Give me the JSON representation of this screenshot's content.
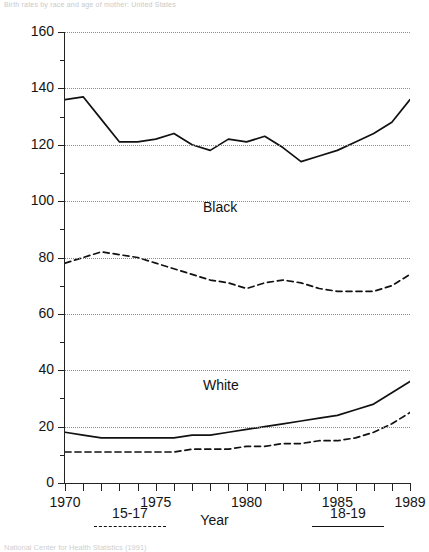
{
  "top_caption": "Birth rates by race and age of mother: United States",
  "bottom_caption": "National Center for Health Statistics (1991)",
  "axis": {
    "x_title": "Year",
    "x_ticklabels": [
      "1970",
      "1975",
      "1980",
      "1985",
      "1989"
    ],
    "x_tickvalues": [
      1970,
      1975,
      1980,
      1985,
      1989
    ],
    "y_ticklabels": [
      "0",
      "20",
      "40",
      "60",
      "80",
      "100",
      "120",
      "140",
      "160"
    ],
    "y_tickvalues": [
      0,
      20,
      40,
      60,
      80,
      100,
      120,
      140,
      160
    ],
    "y_minor": [
      10,
      30,
      50,
      70,
      90,
      110,
      130,
      150
    ]
  },
  "annotations": {
    "black": "Black",
    "white": "White"
  },
  "legend": {
    "items": [
      {
        "label": "15-17",
        "style": "dashed"
      },
      {
        "label": "18-19",
        "style": "solid"
      }
    ]
  },
  "chart_data": {
    "type": "line",
    "title": "Birth rates by race and age of mother: United States",
    "xlabel": "Year",
    "ylabel": "",
    "xlim": [
      1970,
      1989
    ],
    "ylim": [
      0,
      160
    ],
    "grid": true,
    "legend_position": "bottom",
    "x": [
      1970,
      1971,
      1972,
      1973,
      1974,
      1975,
      1976,
      1977,
      1978,
      1979,
      1980,
      1981,
      1982,
      1983,
      1984,
      1985,
      1986,
      1987,
      1988,
      1989
    ],
    "series": [
      {
        "name": "Black 18-19",
        "group": "Black",
        "age": "18-19",
        "style": "solid",
        "color": "#111111",
        "values": [
          136,
          137,
          129,
          121,
          121,
          122,
          124,
          120,
          118,
          122,
          121,
          123,
          119,
          114,
          116,
          118,
          121,
          124,
          128,
          136
        ]
      },
      {
        "name": "Black 15-17",
        "group": "Black",
        "age": "15-17",
        "style": "dashed",
        "color": "#111111",
        "values": [
          78,
          80,
          82,
          81,
          80,
          78,
          76,
          74,
          72,
          71,
          69,
          71,
          72,
          71,
          69,
          68,
          68,
          68,
          70,
          74
        ]
      },
      {
        "name": "White 18-19",
        "group": "White",
        "age": "18-19",
        "style": "solid",
        "color": "#111111",
        "values": [
          18,
          17,
          16,
          16,
          16,
          16,
          16,
          17,
          17,
          18,
          19,
          20,
          21,
          22,
          23,
          24,
          26,
          28,
          32,
          36
        ]
      },
      {
        "name": "White 15-17",
        "group": "White",
        "age": "15-17",
        "style": "dashed",
        "color": "#111111",
        "values": [
          11,
          11,
          11,
          11,
          11,
          11,
          11,
          12,
          12,
          12,
          13,
          13,
          14,
          14,
          15,
          15,
          16,
          18,
          21,
          25
        ]
      }
    ]
  }
}
